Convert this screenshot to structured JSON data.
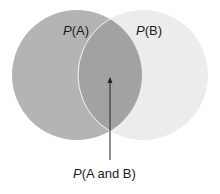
{
  "diagram": {
    "type": "venn",
    "sets": [
      {
        "id": "A",
        "label_var": "P",
        "label_rest": "(A)",
        "label": "P(A)",
        "color": "#b4b4b4",
        "cx": 77,
        "cy": 75,
        "r": 65
      },
      {
        "id": "B",
        "label_var": "P",
        "label_rest": "(B)",
        "label": "P(B)",
        "color": "#ececec",
        "cx": 143,
        "cy": 75,
        "r": 65
      }
    ],
    "intersection": {
      "label_var": "P",
      "label_rest": "(A and B)",
      "label": "P(A and B)",
      "color": "#a2a2a2"
    },
    "pointer": {
      "x": 110,
      "y_start": 160,
      "y_end": 78,
      "color": "#222222"
    },
    "background": "#ffffff"
  }
}
